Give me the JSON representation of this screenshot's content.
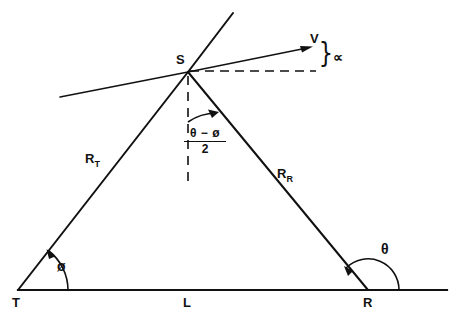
{
  "figure": {
    "type": "geometry-diagram",
    "background_color": "#ffffff",
    "line_color": "#111111"
  },
  "labels": {
    "transmitter": "T",
    "receiver": "R",
    "target": "S",
    "baseline": "L",
    "range_transmitter_base": "R",
    "range_transmitter_sub": "T",
    "range_receiver_base": "R",
    "range_receiver_sub": "R",
    "velocity": "V",
    "alpha": "∝",
    "phi": "ø",
    "theta": "θ"
  },
  "bisector_angle": {
    "numerator": "θ − ø",
    "denominator": "2"
  },
  "angles": [
    {
      "name": "phi-angle-at-T",
      "vertex": "T",
      "label": "ø"
    },
    {
      "name": "theta-angle-at-R",
      "vertex": "R",
      "label": "θ"
    },
    {
      "name": "bisector-angle-at-S",
      "vertex": "S",
      "label": "(θ − ø)/2"
    },
    {
      "name": "alpha-angle-at-V",
      "vertex": "S",
      "label": "∝"
    }
  ],
  "geometry": {
    "T": [
      18,
      290
    ],
    "R": [
      368,
      290
    ],
    "S": [
      188,
      72
    ],
    "baseline_x_end": 447,
    "velocity_arrow_tip": [
      313,
      47
    ],
    "tangent_left_end": [
      60,
      97
    ],
    "rt_extension_top": [
      233,
      12
    ],
    "dashed_vertical_bottom": 186,
    "dashed_horizontal_end": 316
  }
}
